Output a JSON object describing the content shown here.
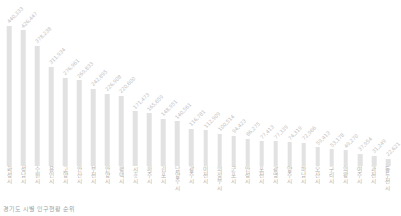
{
  "caption": "경기도 시별 인구현황 순위",
  "colors": {
    "bar": "#e2e2e2",
    "value_label": "#c2c2c2",
    "axis_label": "#b0b0b0",
    "caption": "#9f9f9f",
    "background": "#ffffff"
  },
  "chart_data": {
    "type": "bar",
    "title": "경기도 시별 인구현황 순위",
    "subtitle": "",
    "xlabel": "",
    "ylabel": "",
    "grid": false,
    "legend": false,
    "ylim": [
      0,
      440333
    ],
    "orientation": "vertical",
    "sorted": "descending",
    "categories": [
      "화성시",
      "성남시",
      "수원시",
      "용인시",
      "고양시",
      "안산시",
      "부천시",
      "안양시",
      "평택시",
      "시흥시",
      "파주시",
      "김포시",
      "남양주시",
      "광주시",
      "이천시",
      "의정부시",
      "군포시",
      "안성시",
      "포천시",
      "광명시",
      "양주시",
      "하남시",
      "오산시",
      "구리시",
      "의왕시",
      "여주시",
      "과천시",
      "동두천시"
    ],
    "values": [
      440333,
      426447,
      378238,
      311934,
      276961,
      269833,
      242895,
      226908,
      220600,
      171473,
      165659,
      148951,
      140561,
      116781,
      112909,
      100514,
      94423,
      86275,
      77413,
      77339,
      74319,
      72966,
      59413,
      53178,
      49270,
      37954,
      31249,
      22621
    ],
    "value_labels": [
      "440,333",
      "426,447",
      "378,238",
      "311,934",
      "276,961",
      "269,833",
      "242,895",
      "226,908",
      "220,600",
      "171,473",
      "165,659",
      "148,951",
      "140,561",
      "116,781",
      "112,909",
      "100,514",
      "94,423",
      "86,275",
      "77,413",
      "77,339",
      "74,319",
      "72,966",
      "59,413",
      "53,178",
      "49,270",
      "37,954",
      "31,249",
      "22,621"
    ]
  }
}
